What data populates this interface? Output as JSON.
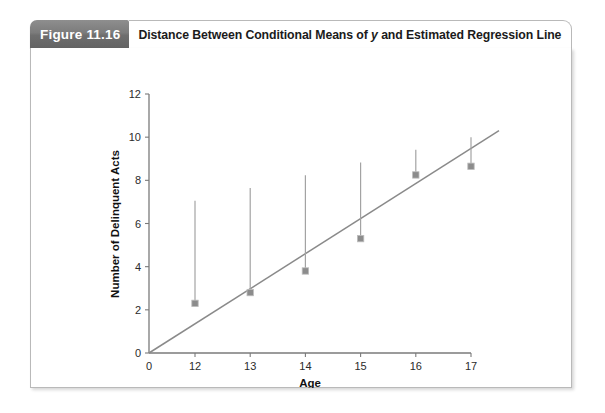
{
  "figure": {
    "number_label": "Figure 11.16",
    "title_part1": "Distance Between Conditional Means of ",
    "title_italic": "y",
    "title_part2": " and Estimated Regression Line"
  },
  "colors": {
    "tab_background": "#7c7c7c",
    "tab_text": "#ffffff",
    "card_border": "#b9b9b9",
    "axis": "#7a7a7a",
    "regression_line": "#8a8a8a",
    "marker": "#8c8c8c",
    "drop_line": "#a3a3a3",
    "page_background": "#ffffff"
  },
  "chart_data": {
    "type": "scatter",
    "title": "",
    "xlabel": "Age",
    "ylabel": "Number of Delinquent Acts",
    "x": [
      12,
      13,
      14,
      15,
      16,
      17
    ],
    "values": [
      2.3,
      2.8,
      3.8,
      5.3,
      8.25,
      8.65
    ],
    "series": [
      {
        "name": "Conditional means of y",
        "values": [
          2.3,
          2.8,
          3.8,
          5.3,
          8.25,
          8.65
        ]
      },
      {
        "name": "Estimated regression line",
        "type": "line",
        "x": [
          0,
          17.85
        ],
        "values": [
          0,
          10.5
        ]
      }
    ],
    "residuals": [
      0.65,
      0.2,
      -0.3,
      -1.25,
      0.8,
      0.35
    ],
    "xlim": [
      0,
      17.85
    ],
    "ylim": [
      0,
      12
    ],
    "xticks": [
      0,
      12,
      13,
      14,
      15,
      16,
      17
    ],
    "xtick_labels": [
      "0",
      "12",
      "13",
      "14",
      "15",
      "16",
      "17"
    ],
    "yticks": [
      0,
      2,
      4,
      6,
      8,
      10,
      12
    ],
    "ytick_labels": [
      "0",
      "2",
      "4",
      "6",
      "8",
      "10",
      "12"
    ],
    "axis_break": true,
    "grid": false,
    "legend": "none"
  }
}
